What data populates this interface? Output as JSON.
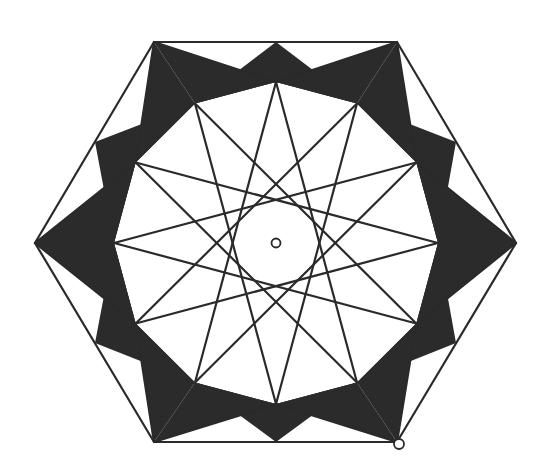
{
  "figure": {
    "title": "",
    "center": {
      "x": 276,
      "y": 243
    },
    "colors": {
      "background": "#ffffff",
      "line": "#2a2a2a",
      "dark_fill": "#2b2b2b",
      "gray_fill": "#8a8a8a"
    },
    "outer_hexagon": [
      [
        154,
        42
      ],
      [
        397,
        42
      ],
      [
        516,
        243
      ],
      [
        397,
        442
      ],
      [
        154,
        442
      ],
      [
        35,
        243
      ]
    ],
    "outer_points": [
      [
        276,
        42
      ],
      [
        397,
        42
      ],
      [
        456,
        142
      ],
      [
        516,
        243
      ],
      [
        456,
        343
      ],
      [
        397,
        442
      ],
      [
        276,
        442
      ],
      [
        154,
        442
      ],
      [
        95,
        343
      ],
      [
        35,
        243
      ],
      [
        95,
        142
      ],
      [
        154,
        42
      ]
    ],
    "inner_radius": {
      "x": 162,
      "y": 161
    },
    "star_step": 5,
    "markers": [
      {
        "name": "center-point",
        "x": 276,
        "y": 243,
        "r": 4.5
      },
      {
        "name": "corner-point",
        "x": 399,
        "y": 444,
        "r": 5
      }
    ]
  }
}
